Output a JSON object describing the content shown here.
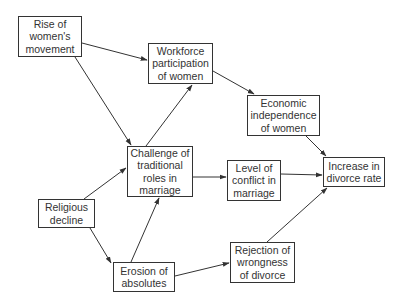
{
  "diagram": {
    "type": "causal-flow",
    "nodes": [
      {
        "id": "rise",
        "label": "Rise of\nwomen's\nmovement"
      },
      {
        "id": "workforce",
        "label": "Workforce\nparticipation\nof women"
      },
      {
        "id": "economic",
        "label": "Economic\nindependence\nof women"
      },
      {
        "id": "challenge",
        "label": "Challenge of\ntraditional\nroles in\nmarriage"
      },
      {
        "id": "conflict",
        "label": "Level of\nconflict in\nmarriage"
      },
      {
        "id": "divorce",
        "label": "Increase in\ndivorce rate"
      },
      {
        "id": "religious",
        "label": "Religious\ndecline"
      },
      {
        "id": "erosion",
        "label": "Erosion of\nabsolutes"
      },
      {
        "id": "rejection",
        "label": "Rejection of\nwrongness\nof divorce"
      }
    ],
    "edges": [
      {
        "from": "rise",
        "to": "workforce"
      },
      {
        "from": "rise",
        "to": "challenge"
      },
      {
        "from": "workforce",
        "to": "economic"
      },
      {
        "from": "challenge",
        "to": "workforce"
      },
      {
        "from": "economic",
        "to": "divorce"
      },
      {
        "from": "challenge",
        "to": "conflict"
      },
      {
        "from": "conflict",
        "to": "divorce"
      },
      {
        "from": "religious",
        "to": "challenge"
      },
      {
        "from": "religious",
        "to": "erosion"
      },
      {
        "from": "erosion",
        "to": "challenge"
      },
      {
        "from": "erosion",
        "to": "rejection"
      },
      {
        "from": "rejection",
        "to": "divorce"
      }
    ],
    "colors": {
      "line": "#333333",
      "box_border": "#333333",
      "text": "#333333",
      "background": "#ffffff"
    }
  }
}
